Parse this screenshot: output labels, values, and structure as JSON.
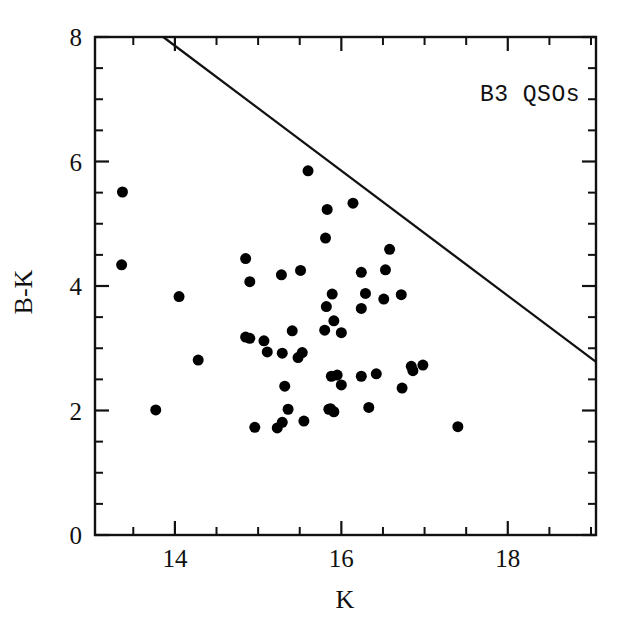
{
  "chart_data": {
    "type": "scatter",
    "title": "",
    "annotation": "B3 QSOs",
    "xlabel": "K",
    "ylabel": "B-K",
    "xlim": [
      13.04,
      19.06
    ],
    "ylim": [
      0,
      8
    ],
    "grid": false,
    "legend_position": "none",
    "x_ticks_major": [
      14,
      16,
      18
    ],
    "x_tick_labels": [
      "14",
      "16",
      "18"
    ],
    "x_ticks_minor": [
      13.5,
      14.5,
      15,
      15.5,
      16.5,
      17,
      17.5,
      18.5,
      19
    ],
    "y_ticks_major": [
      0,
      2,
      4,
      6,
      8
    ],
    "y_tick_labels": [
      "0",
      "2",
      "4",
      "6",
      "8"
    ],
    "y_ticks_minor": [
      0.5,
      1,
      1.5,
      2.5,
      3,
      3.5,
      4.5,
      5,
      5.5,
      6.5,
      7,
      7.5
    ],
    "marker": "filled-circle",
    "marker_color": "#000000",
    "marker_size_px": 11,
    "points": [
      {
        "x": 13.37,
        "y": 5.51
      },
      {
        "x": 13.36,
        "y": 4.34
      },
      {
        "x": 13.77,
        "y": 2.01
      },
      {
        "x": 14.05,
        "y": 3.83
      },
      {
        "x": 14.28,
        "y": 2.81
      },
      {
        "x": 14.85,
        "y": 4.44
      },
      {
        "x": 14.9,
        "y": 4.07
      },
      {
        "x": 14.85,
        "y": 3.18
      },
      {
        "x": 14.9,
        "y": 3.16
      },
      {
        "x": 14.96,
        "y": 1.73
      },
      {
        "x": 15.07,
        "y": 3.12
      },
      {
        "x": 15.11,
        "y": 2.94
      },
      {
        "x": 15.23,
        "y": 1.72
      },
      {
        "x": 15.28,
        "y": 4.18
      },
      {
        "x": 15.29,
        "y": 2.92
      },
      {
        "x": 15.29,
        "y": 1.81
      },
      {
        "x": 15.32,
        "y": 2.39
      },
      {
        "x": 15.36,
        "y": 2.02
      },
      {
        "x": 15.41,
        "y": 3.28
      },
      {
        "x": 15.48,
        "y": 2.85
      },
      {
        "x": 15.51,
        "y": 4.25
      },
      {
        "x": 15.53,
        "y": 2.93
      },
      {
        "x": 15.55,
        "y": 1.83
      },
      {
        "x": 15.6,
        "y": 5.85
      },
      {
        "x": 15.8,
        "y": 3.29
      },
      {
        "x": 15.81,
        "y": 4.77
      },
      {
        "x": 15.82,
        "y": 3.67
      },
      {
        "x": 15.83,
        "y": 5.23
      },
      {
        "x": 15.85,
        "y": 2.02
      },
      {
        "x": 15.87,
        "y": 2.03
      },
      {
        "x": 15.88,
        "y": 2.55
      },
      {
        "x": 15.89,
        "y": 3.87
      },
      {
        "x": 15.91,
        "y": 3.44
      },
      {
        "x": 15.91,
        "y": 1.98
      },
      {
        "x": 15.95,
        "y": 2.57
      },
      {
        "x": 16.0,
        "y": 3.25
      },
      {
        "x": 16.0,
        "y": 2.41
      },
      {
        "x": 16.14,
        "y": 5.33
      },
      {
        "x": 16.24,
        "y": 4.22
      },
      {
        "x": 16.24,
        "y": 3.64
      },
      {
        "x": 16.24,
        "y": 2.55
      },
      {
        "x": 16.29,
        "y": 3.88
      },
      {
        "x": 16.33,
        "y": 2.05
      },
      {
        "x": 16.42,
        "y": 2.59
      },
      {
        "x": 16.51,
        "y": 3.79
      },
      {
        "x": 16.53,
        "y": 4.26
      },
      {
        "x": 16.58,
        "y": 4.59
      },
      {
        "x": 16.72,
        "y": 3.86
      },
      {
        "x": 16.73,
        "y": 2.36
      },
      {
        "x": 16.84,
        "y": 2.71
      },
      {
        "x": 16.86,
        "y": 2.64
      },
      {
        "x": 16.98,
        "y": 2.73
      },
      {
        "x": 17.4,
        "y": 1.74
      }
    ],
    "boundary_line": {
      "label": "",
      "x_start": 13.86,
      "y_start": 8.0,
      "x_end": 19.06,
      "y_end": 2.78
    }
  }
}
